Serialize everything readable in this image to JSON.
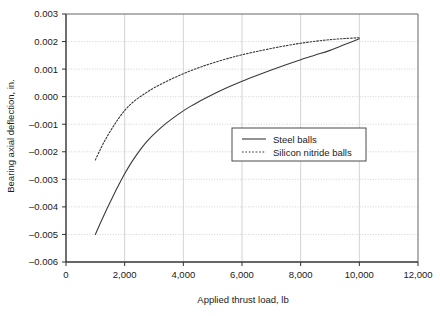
{
  "chart_data": {
    "type": "line",
    "title": "",
    "xlabel": "Applied thrust load, lb",
    "ylabel": "Bearing axial deflection, in.",
    "xlim": [
      0,
      12000
    ],
    "ylim": [
      -0.006,
      0.003
    ],
    "xticks": [
      0,
      2000,
      4000,
      6000,
      8000,
      10000,
      12000
    ],
    "xticklabels": [
      "0",
      "2,000",
      "4,000",
      "6,000",
      "8,000",
      "10,000",
      "12,000"
    ],
    "yticks": [
      0.003,
      0.002,
      0.001,
      0.0,
      -0.001,
      -0.002,
      -0.003,
      -0.004,
      -0.005,
      -0.006
    ],
    "yticklabels": [
      "0.003",
      "0.002",
      "0.001",
      "0.000",
      "–0.001",
      "–0.002",
      "–0.003",
      "–0.004",
      "–0.005",
      "–0.006"
    ],
    "grid": true,
    "grid_color": "#c8c8c8",
    "legend_position": "center-right",
    "series": [
      {
        "name": "Steel balls",
        "style": "solid",
        "color": "#3a3a3a",
        "x": [
          1000,
          1200,
          1400,
          1600,
          1800,
          2000,
          2200,
          2400,
          2600,
          2800,
          3000,
          3400,
          3800,
          4200,
          4600,
          5000,
          5500,
          6000,
          6500,
          7000,
          7500,
          8000,
          8500,
          9000,
          9500,
          10000
        ],
        "y": [
          -0.005,
          -0.00452,
          -0.00406,
          -0.00362,
          -0.0032,
          -0.0028,
          -0.00244,
          -0.00212,
          -0.00183,
          -0.00158,
          -0.00136,
          -0.00098,
          -0.00066,
          -0.00038,
          -0.00014,
          8e-05,
          0.00033,
          0.00056,
          0.00077,
          0.00097,
          0.00116,
          0.00134,
          0.00151,
          0.00168,
          0.00189,
          0.0021
        ]
      },
      {
        "name": "Silicon nitride balls",
        "style": "dotted",
        "color": "#3a3a3a",
        "x": [
          1000,
          1200,
          1400,
          1600,
          1800,
          2000,
          2200,
          2400,
          2600,
          2800,
          3000,
          3400,
          3800,
          4200,
          4600,
          5000,
          5500,
          6000,
          6500,
          7000,
          7500,
          8000,
          8500,
          9000,
          9500,
          10000
        ],
        "y": [
          -0.0023,
          -0.00185,
          -0.00145,
          -0.0011,
          -0.00078,
          -0.0005,
          -0.00028,
          -0.0001,
          5e-05,
          0.00019,
          0.00032,
          0.00054,
          0.00074,
          0.00092,
          0.00108,
          0.00122,
          0.00138,
          0.00152,
          0.00164,
          0.00175,
          0.00185,
          0.00194,
          0.00201,
          0.00207,
          0.00211,
          0.00214
        ]
      }
    ]
  },
  "legend": {
    "entries": [
      {
        "label": "Steel balls"
      },
      {
        "label": "Silicon nitride balls"
      }
    ]
  }
}
